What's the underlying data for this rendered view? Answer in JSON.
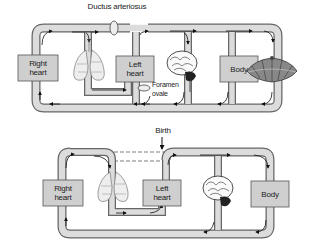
{
  "diagram": {
    "before_birth": {
      "labels": {
        "ductus_arteriosus": "Ductus arteriosus",
        "right_heart": [
          "Right",
          "heart"
        ],
        "left_heart": [
          "Left",
          "heart"
        ],
        "foramen_ovale": [
          "Foramen",
          "ovale"
        ],
        "body": "Body"
      },
      "organs": [
        "lungs",
        "brain",
        "placenta"
      ]
    },
    "transition": {
      "label": "Birth"
    },
    "after_birth": {
      "labels": {
        "right_heart": [
          "Right",
          "heart"
        ],
        "left_heart": [
          "Left",
          "heart"
        ],
        "body": "Body"
      },
      "organs": [
        "lungs",
        "brain"
      ]
    },
    "colors": {
      "vessel_fill": "#dcdcdc",
      "vessel_stroke": "#555555",
      "box_fill": "#cfcfcf",
      "arrow": "#111111"
    }
  }
}
